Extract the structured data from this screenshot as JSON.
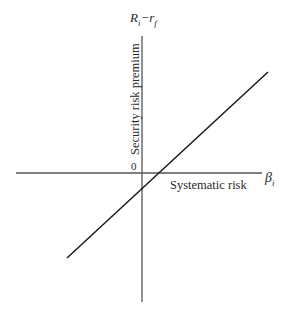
{
  "diagram": {
    "title": "",
    "y_axis": {
      "symbol_main": "R",
      "symbol_sub1": "i",
      "symbol_minus": "−",
      "symbol_r": "r",
      "symbol_sub2": "f",
      "caption": "Security risk premium"
    },
    "x_axis": {
      "symbol_main": "β",
      "symbol_sub": "i",
      "caption": "Systematic risk"
    },
    "origin_label": "0",
    "line": {
      "description": "Upward-sloping straight line through the origin",
      "passes_through_origin": true,
      "direction": "positive slope"
    },
    "colors": {
      "axis": "#555555",
      "line": "#1a1a1a",
      "text": "#2a2a2a"
    }
  }
}
